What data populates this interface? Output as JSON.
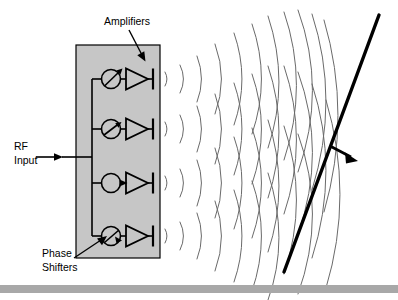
{
  "figure": {
    "background_color": "#ffffff",
    "width": 398,
    "height": 300
  },
  "labels": {
    "amplifiers": "Amplifiers",
    "phase_shifters_line1": "Phase",
    "phase_shifters_line2": "Shifters",
    "rf_input_line1": "RF",
    "rf_input_line2": "Input"
  },
  "colors": {
    "panel_fill": "#c6c6c6",
    "panel_stroke": "#000000",
    "line": "#000000",
    "wavefront": "#6a6a6a",
    "beam": "#000000",
    "footer_bar": "#a8a8a8",
    "text": "#000000"
  },
  "panel": {
    "x": 76,
    "y": 45,
    "width": 84,
    "height": 213
  },
  "channels": [
    {
      "index": 1,
      "y": 79,
      "phase_shift": true
    },
    {
      "index": 2,
      "y": 129,
      "phase_shift": true
    },
    {
      "index": 3,
      "y": 183,
      "phase_shift": false
    },
    {
      "index": 4,
      "y": 236,
      "phase_shift": true
    }
  ],
  "element_names": {
    "phase_shifter": "phase-shifter-symbol",
    "amplifier": "amplifier-symbol",
    "antenna": "antenna-element",
    "wavefront": "wavefront-arc",
    "beam_line": "combined-wavefront-line",
    "beam_arrow": "beam-direction-arrow",
    "feed_network": "rf-feed-network"
  },
  "counts": {
    "channels": 4,
    "wavefront_columns": 11
  }
}
